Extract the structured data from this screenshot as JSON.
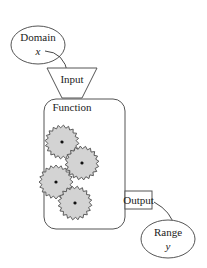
{
  "diagram": {
    "type": "function-machine",
    "nodes": {
      "domain": {
        "label": "Domain",
        "variable": "x"
      },
      "input": {
        "label": "Input"
      },
      "function": {
        "label": "Function",
        "gear_count": 4
      },
      "output": {
        "label": "Output"
      },
      "range": {
        "label": "Range",
        "variable": "y"
      }
    },
    "edges": [
      {
        "from": "domain",
        "to": "input"
      },
      {
        "from": "output",
        "to": "range"
      }
    ],
    "colors": {
      "stroke": "#555555",
      "gear_fill": "#d3d3d3",
      "box_fill": "#ffffff"
    }
  }
}
